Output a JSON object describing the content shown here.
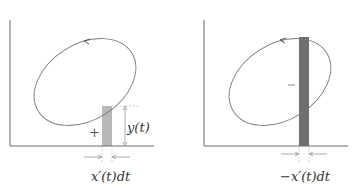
{
  "figure": {
    "left_panel": {
      "sign_label": "+",
      "height_label": "y(t)",
      "width_label": "x′(t)dt",
      "strip_color": "#b8b8b8"
    },
    "right_panel": {
      "sign_label": "−",
      "width_label": "−x′(t)dt",
      "strip_color": "#6e6e6e"
    },
    "colors": {
      "axis": "#6a6a6a",
      "curve": "#7a7a7a",
      "guide": "#aaaaaa"
    }
  }
}
